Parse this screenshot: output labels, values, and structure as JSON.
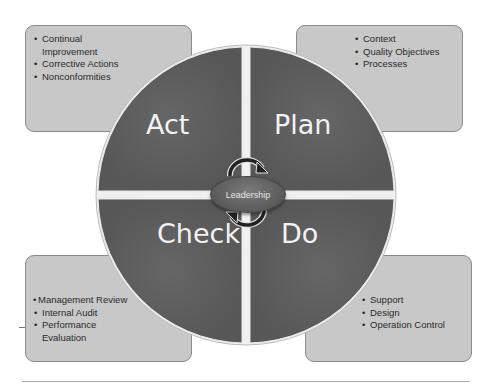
{
  "diagram": {
    "type": "PDCA cycle",
    "colors": {
      "segment": "#5e5e5e",
      "box": "#c8c8c8",
      "segment_text": "#f2f2f2",
      "center": "#666666"
    },
    "center": {
      "label": "Leadership"
    },
    "segments": {
      "act": {
        "label": "Act"
      },
      "plan": {
        "label": "Plan"
      },
      "check": {
        "label": "Check"
      },
      "do": {
        "label": "Do"
      }
    },
    "boxes": {
      "act": {
        "items": [
          "Continual Improvement",
          "Corrective Actions",
          "Nonconformities"
        ]
      },
      "plan": {
        "items": [
          "Context",
          "Quality Objectives",
          "Processes"
        ]
      },
      "check": {
        "items": [
          "Management Review",
          "Internal Audit",
          "Performance Evaluation"
        ]
      },
      "do": {
        "items": [
          "Support",
          "Design",
          "Operation Control"
        ]
      }
    }
  }
}
